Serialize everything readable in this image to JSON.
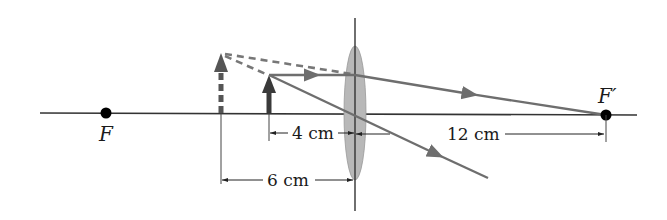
{
  "diagram": {
    "colors": {
      "axis": "#333333",
      "ray": "#6e6e6e",
      "lens_fill": "#b8b8b8",
      "object": "#3a3a3a",
      "virtual": "#555555",
      "dimension": "#333333",
      "focal_point": "#000000"
    },
    "labels": {
      "focal_left": "F",
      "focal_right": "F′",
      "dim_object_distance": "4 cm",
      "dim_focal_length": "12 cm",
      "dim_image_distance": "6 cm"
    },
    "elements": {
      "optical_axis": "horizontal principal axis",
      "lens": "thin converging lens",
      "object_arrow": "real object (solid arrow)",
      "image_arrow": "virtual image (dashed arrow)",
      "ray_parallel": "ray parallel to axis refracted through F′",
      "ray_center": "ray through lens center undeviated",
      "virtual_extensions": "dashed backward extensions of rays"
    }
  }
}
